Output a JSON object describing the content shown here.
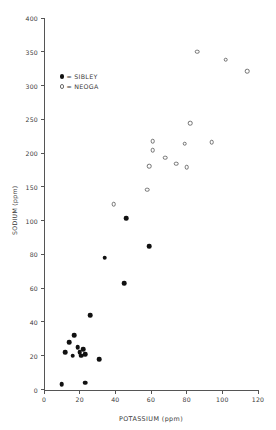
{
  "chart_data": {
    "type": "scatter",
    "title": "",
    "xlabel": "POTASSIUM (ppm)",
    "ylabel": "SODIUM (ppm)",
    "xlim": [
      0,
      120
    ],
    "ylim": [
      0,
      400
    ],
    "grid": false,
    "y_axis_note": "piecewise scale: equal pixel spacing for 0,20,40,60,80,100 then 150,200,250,300,350,400",
    "xticks": [
      0,
      20,
      40,
      60,
      80,
      100,
      120
    ],
    "xtick_labels": [
      "0",
      "20",
      "40",
      "60",
      "80",
      "100",
      "120"
    ],
    "yticks": [
      0,
      20,
      40,
      60,
      80,
      100,
      150,
      200,
      250,
      300,
      350,
      400
    ],
    "ytick_labels": [
      "0",
      "20",
      "40",
      "60",
      "80",
      "100",
      "150",
      "200",
      "250",
      "300",
      "350",
      "400"
    ],
    "legend_position": "upper-left-inside",
    "series": [
      {
        "name": "SIBLEY",
        "marker": "filled-circle",
        "color": "#111111",
        "legend_label": "= SIBLEY",
        "points": [
          {
            "x": 10,
            "y": 3
          },
          {
            "x": 23,
            "y": 4
          },
          {
            "x": 12,
            "y": 22
          },
          {
            "x": 14,
            "y": 28
          },
          {
            "x": 16,
            "y": 20
          },
          {
            "x": 17,
            "y": 32
          },
          {
            "x": 19,
            "y": 25
          },
          {
            "x": 20,
            "y": 22
          },
          {
            "x": 21,
            "y": 20
          },
          {
            "x": 22,
            "y": 24
          },
          {
            "x": 23,
            "y": 21
          },
          {
            "x": 26,
            "y": 44
          },
          {
            "x": 31,
            "y": 18
          },
          {
            "x": 34,
            "y": 78
          },
          {
            "x": 45,
            "y": 63
          },
          {
            "x": 46,
            "y": 104
          },
          {
            "x": 59,
            "y": 85
          }
        ]
      },
      {
        "name": "NEOGA",
        "marker": "open-circle",
        "color": "#707070",
        "legend_label": "= NEOGA",
        "points": [
          {
            "x": 39,
            "y": 124
          },
          {
            "x": 58,
            "y": 146
          },
          {
            "x": 61,
            "y": 218
          },
          {
            "x": 61,
            "y": 204
          },
          {
            "x": 59,
            "y": 181
          },
          {
            "x": 68,
            "y": 193
          },
          {
            "x": 74,
            "y": 184
          },
          {
            "x": 79,
            "y": 214
          },
          {
            "x": 80,
            "y": 179
          },
          {
            "x": 82,
            "y": 244
          },
          {
            "x": 86,
            "y": 350
          },
          {
            "x": 94,
            "y": 216
          },
          {
            "x": 102,
            "y": 338
          },
          {
            "x": 114,
            "y": 321
          }
        ]
      }
    ]
  },
  "legend": {
    "sibley": "= SIBLEY",
    "neoga": "= NEOGA"
  }
}
